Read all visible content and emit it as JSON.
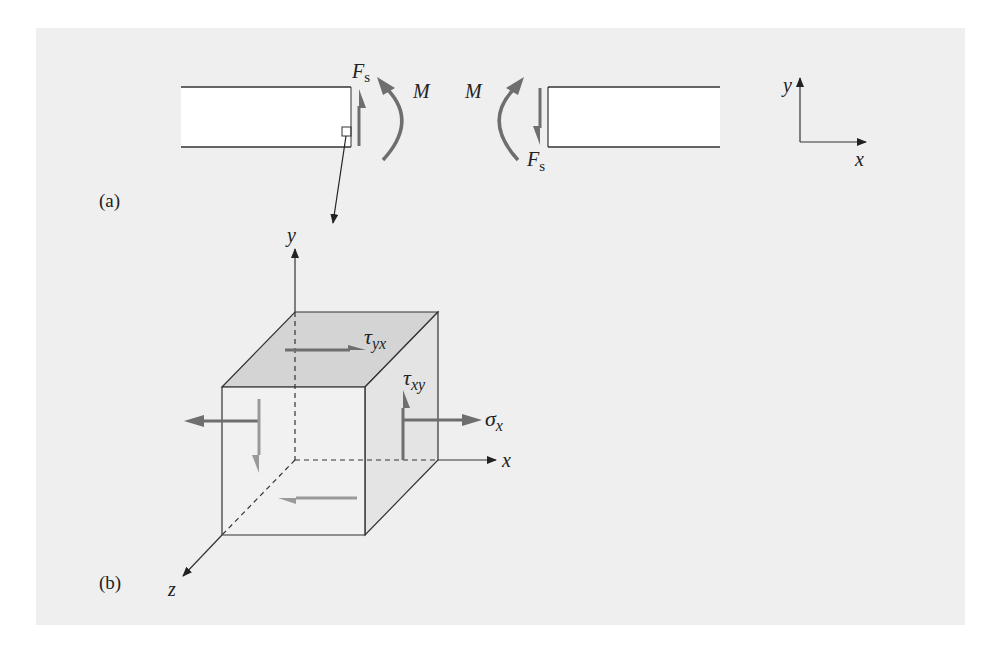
{
  "figure": {
    "background_color": "#efefef",
    "line_color": "#333333",
    "force_arrow_color": "#6e6e6e",
    "face_top_color": "#d4d4d4",
    "face_side_color": "#e4e4e4"
  },
  "part_a": {
    "tag": "(a)",
    "left_beam": {
      "shear_label": "F",
      "shear_subscript": "s",
      "moment_label": "M"
    },
    "right_beam": {
      "shear_label": "F",
      "shear_subscript": "s",
      "moment_label": "M"
    },
    "axes": {
      "x_label": "x",
      "y_label": "y"
    }
  },
  "part_b": {
    "tag": "(b)",
    "axes": {
      "x_label": "x",
      "y_label": "y",
      "z_label": "z"
    },
    "stresses": {
      "tau_yx": {
        "symbol": "τ",
        "subscript": "yx"
      },
      "tau_xy": {
        "symbol": "τ",
        "subscript": "xy"
      },
      "sigma_x": {
        "symbol": "σ",
        "subscript": "x"
      }
    }
  }
}
